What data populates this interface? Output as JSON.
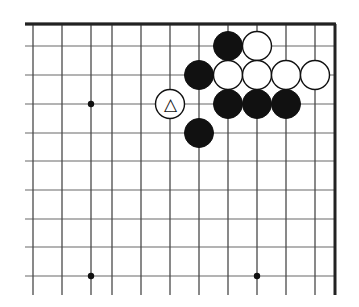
{
  "figure": {
    "kind": "go-board-diagram",
    "board_background": "#ffffff",
    "line_color": "#4a4a4a",
    "line_color_light": "#9a9a9a",
    "edge_color": "#222222",
    "black_stone_color": "#111111",
    "white_stone_color": "#ffffff",
    "white_stone_border": "#111111",
    "mark_color": "#111111"
  },
  "geometry": {
    "width": 359,
    "height": 307,
    "columns_x": [
      33,
      62,
      91,
      112,
      141,
      170,
      199,
      228,
      257,
      286,
      315
    ],
    "rows_y": [
      24,
      46,
      75,
      104,
      133,
      161,
      190,
      219,
      247,
      276
    ],
    "stone_radius": 14.5,
    "edge_top_y": 24,
    "edge_right_x": 335,
    "grid_left_x": 25,
    "grid_bottom_y": 295
  },
  "star_points": [
    {
      "name": "star-point-left-upper",
      "x": 91,
      "y": 104
    },
    {
      "name": "star-point-left-lower",
      "x": 91,
      "y": 276
    },
    {
      "name": "star-point-center-lower",
      "x": 257,
      "y": 276
    }
  ],
  "stones": [
    {
      "id": 1,
      "color": "black",
      "x": 228,
      "y": 46,
      "mark": "none",
      "label": ""
    },
    {
      "id": 2,
      "color": "white",
      "x": 257,
      "y": 46,
      "mark": "none",
      "label": ""
    },
    {
      "id": 3,
      "color": "black",
      "x": 199,
      "y": 75,
      "mark": "none",
      "label": ""
    },
    {
      "id": 4,
      "color": "white",
      "x": 228,
      "y": 75,
      "mark": "none",
      "label": ""
    },
    {
      "id": 5,
      "color": "white",
      "x": 257,
      "y": 75,
      "mark": "none",
      "label": ""
    },
    {
      "id": 6,
      "color": "white",
      "x": 286,
      "y": 75,
      "mark": "none",
      "label": ""
    },
    {
      "id": 7,
      "color": "white",
      "x": 315,
      "y": 75,
      "mark": "none",
      "label": ""
    },
    {
      "id": 8,
      "color": "white",
      "x": 170,
      "y": 104,
      "mark": "triangle",
      "label": "△"
    },
    {
      "id": 9,
      "color": "black",
      "x": 228,
      "y": 104,
      "mark": "none",
      "label": ""
    },
    {
      "id": 10,
      "color": "black",
      "x": 257,
      "y": 104,
      "mark": "none",
      "label": ""
    },
    {
      "id": 11,
      "color": "black",
      "x": 286,
      "y": 104,
      "mark": "none",
      "label": ""
    },
    {
      "id": 12,
      "color": "black",
      "x": 199,
      "y": 133,
      "mark": "none",
      "label": ""
    }
  ],
  "counts": {
    "black_stones": "6",
    "white_stones": "6",
    "marked_stones": "1"
  }
}
